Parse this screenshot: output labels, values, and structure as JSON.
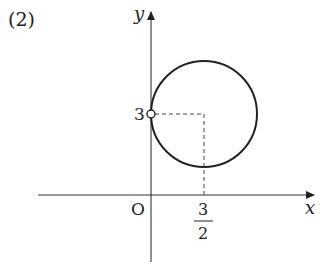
{
  "problem_label": "(2)",
  "axes": {
    "x_label": "x",
    "y_label": "y",
    "origin_label": "O"
  },
  "point": {
    "y_tick_label": "3",
    "x_tick_numerator": "3",
    "x_tick_denominator": "2",
    "style": "open-circle"
  },
  "circle": {
    "center": [
      1.5,
      3
    ],
    "radius": 1.5,
    "note": "circle tangent to y-axis at (0,3), point (0,3) excluded"
  },
  "colors": {
    "stroke": "#222222",
    "axis": "#333333",
    "dashed": "#444444"
  }
}
